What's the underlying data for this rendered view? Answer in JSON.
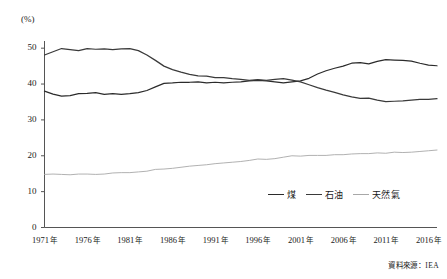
{
  "figure": {
    "unit_label": "(%)",
    "source_note": "資料來源：IEA"
  },
  "legend": {
    "position": "inside-bottom-right",
    "entries": [
      {
        "label": "煤",
        "color": "#2b2b2b"
      },
      {
        "label": "石油",
        "color": "#3a3a3a"
      },
      {
        "label": "天然氣",
        "color": "#a8a8a8"
      }
    ]
  },
  "axis": {
    "y_ticks": [
      "0",
      "10",
      "20",
      "30",
      "40",
      "50"
    ],
    "x_ticks": [
      {
        "year": "1971",
        "suffix": "年"
      },
      {
        "year": "1976",
        "suffix": "年"
      },
      {
        "year": "1981",
        "suffix": "年"
      },
      {
        "year": "1986",
        "suffix": "年"
      },
      {
        "year": "1991",
        "suffix": "年"
      },
      {
        "year": "1996",
        "suffix": "年"
      },
      {
        "year": "2001",
        "suffix": "年"
      },
      {
        "year": "2006",
        "suffix": "年"
      },
      {
        "year": "2011",
        "suffix": "年"
      },
      {
        "year": "2016",
        "suffix": "年"
      }
    ]
  },
  "chart_data": {
    "type": "line",
    "title": "",
    "subtitle": "",
    "xlabel": "",
    "ylabel": "(%)",
    "ylim": [
      0,
      52
    ],
    "yticks": [
      0,
      10,
      20,
      30,
      40,
      50
    ],
    "grid": false,
    "legend_position": "inside bottom right",
    "source": "資料來源：IEA",
    "x": [
      1971,
      1972,
      1973,
      1974,
      1975,
      1976,
      1977,
      1978,
      1979,
      1980,
      1981,
      1982,
      1983,
      1984,
      1985,
      1986,
      1987,
      1988,
      1989,
      1990,
      1991,
      1992,
      1993,
      1994,
      1995,
      1996,
      1997,
      1998,
      1999,
      2000,
      2001,
      2002,
      2003,
      2004,
      2005,
      2006,
      2007,
      2008,
      2009,
      2010,
      2011,
      2012,
      2013,
      2014,
      2015,
      2016,
      2017
    ],
    "series": [
      {
        "name": "煤",
        "color": "#2b2b2b",
        "values": [
          38.0,
          37.2,
          36.6,
          36.8,
          37.3,
          37.4,
          37.6,
          37.1,
          37.3,
          37.1,
          37.3,
          37.6,
          38.2,
          39.2,
          40.2,
          40.3,
          40.5,
          40.5,
          40.6,
          40.3,
          40.5,
          40.3,
          40.5,
          40.6,
          40.9,
          41.0,
          40.9,
          40.6,
          40.3,
          40.6,
          40.9,
          41.6,
          42.8,
          43.7,
          44.4,
          45.0,
          45.8,
          46.0,
          45.6,
          46.3,
          46.8,
          46.7,
          46.6,
          46.4,
          45.8,
          45.3,
          45.1
        ]
      },
      {
        "name": "石油",
        "color": "#3a3a3a",
        "values": [
          48.1,
          49.0,
          49.9,
          49.6,
          49.3,
          49.9,
          49.7,
          49.8,
          49.6,
          49.8,
          49.9,
          49.3,
          48.1,
          46.6,
          45.0,
          44.0,
          43.3,
          42.7,
          42.3,
          42.2,
          41.8,
          41.8,
          41.5,
          41.3,
          41.0,
          41.2,
          41.0,
          41.3,
          41.5,
          41.1,
          40.6,
          39.8,
          39.0,
          38.3,
          37.7,
          37.0,
          36.4,
          36.0,
          36.1,
          35.5,
          35.1,
          35.2,
          35.3,
          35.5,
          35.7,
          35.7,
          35.9
        ]
      },
      {
        "name": "天然氣",
        "color": "#a8a8a8",
        "values": [
          14.8,
          14.9,
          14.8,
          14.7,
          14.9,
          14.9,
          14.8,
          14.9,
          15.2,
          15.3,
          15.3,
          15.5,
          15.7,
          16.2,
          16.3,
          16.5,
          16.8,
          17.1,
          17.3,
          17.5,
          17.8,
          18.0,
          18.2,
          18.4,
          18.7,
          19.1,
          19.0,
          19.2,
          19.6,
          20.0,
          19.9,
          20.1,
          20.1,
          20.1,
          20.3,
          20.3,
          20.5,
          20.6,
          20.6,
          20.8,
          20.7,
          21.0,
          20.9,
          21.0,
          21.2,
          21.4,
          21.6
        ]
      }
    ]
  }
}
